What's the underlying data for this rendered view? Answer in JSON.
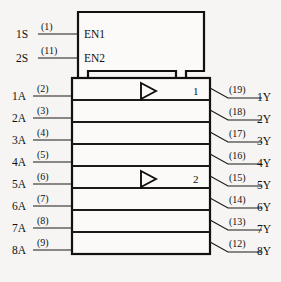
{
  "diagram": {
    "type": "iec-logic-symbol",
    "colors": {
      "background": "#f6f5f3",
      "body_fill": "#fbfaf8",
      "ink": "#111111",
      "line": "#1a1a1a"
    },
    "control_block": {
      "enable_rows": [
        {
          "signal": "1S",
          "pin": "(1)",
          "internal": "EN1"
        },
        {
          "signal": "2S",
          "pin": "(11)",
          "internal": "EN2"
        }
      ]
    },
    "channels": [
      {
        "input": "1A",
        "input_pin": "(2)",
        "output": "1Y",
        "output_pin": "(19)",
        "group": "1",
        "has_triangle": true
      },
      {
        "input": "2A",
        "input_pin": "(3)",
        "output": "2Y",
        "output_pin": "(18)",
        "group": "",
        "has_triangle": false
      },
      {
        "input": "3A",
        "input_pin": "(4)",
        "output": "3Y",
        "output_pin": "(17)",
        "group": "",
        "has_triangle": false
      },
      {
        "input": "4A",
        "input_pin": "(5)",
        "output": "4Y",
        "output_pin": "(16)",
        "group": "",
        "has_triangle": false
      },
      {
        "input": "5A",
        "input_pin": "(6)",
        "output": "5Y",
        "output_pin": "(15)",
        "group": "2",
        "has_triangle": true
      },
      {
        "input": "6A",
        "input_pin": "(7)",
        "output": "6Y",
        "output_pin": "(14)",
        "group": "",
        "has_triangle": false
      },
      {
        "input": "7A",
        "input_pin": "(8)",
        "output": "7Y",
        "output_pin": "(13)",
        "group": "",
        "has_triangle": false
      },
      {
        "input": "8A",
        "input_pin": "(9)",
        "output": "8Y",
        "output_pin": "(12)",
        "group": "",
        "has_triangle": false
      }
    ]
  }
}
